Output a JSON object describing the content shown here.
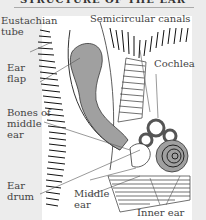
{
  "title": "STRUCTURE OF THE EAR",
  "labels": {
    "eustachian_tube": "Eustachian\ntube",
    "semicircular_canals": "Semicircular canals",
    "ear_flap": "Ear\nflap",
    "cochlea": "Cochlea",
    "bones_of_middle_ear": "Bones of\nmiddle\near",
    "ear_drum": "Ear\ndrum",
    "middle_ear": "Middle\near",
    "inner_ear": "Inner ear"
  },
  "colors": {
    "background": "#ececec",
    "panel": "#ffffff",
    "shaded_structure": "#a0a0a0",
    "line": "#333333",
    "label_text": "#444444"
  }
}
